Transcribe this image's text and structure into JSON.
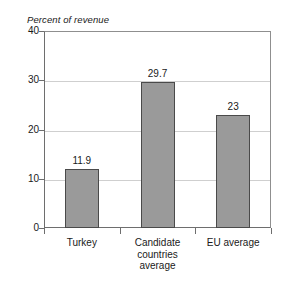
{
  "chart_data": {
    "type": "bar",
    "title": "",
    "subtitle": "",
    "ylabel": "Percent of revenue",
    "xlabel": "",
    "categories": [
      "Turkey",
      "Candidate\ncountries\naverage",
      "EU average"
    ],
    "values": [
      11.9,
      29.7,
      23
    ],
    "value_labels": [
      "11.9",
      "29.7",
      "23"
    ],
    "ylim": [
      0,
      40
    ],
    "yticks": [
      0,
      10,
      20,
      30,
      40
    ],
    "ytick_labels": [
      "0",
      "10",
      "20",
      "30",
      "40"
    ],
    "grid": true,
    "legend": "none",
    "bar_fill_color": "#9a9a9a",
    "bar_border_color": "#4a4a4a",
    "axis_color": "#6e6e6e",
    "gridline_color": "#cfcfcf"
  }
}
